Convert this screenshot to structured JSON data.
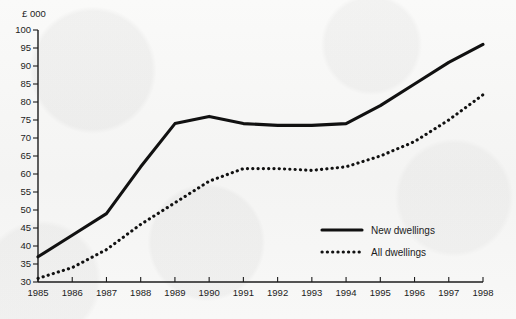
{
  "chart_data": {
    "type": "line",
    "title": "",
    "xlabel": "",
    "ylabel": "",
    "unit_label": "£ 000",
    "grid": false,
    "legend_position": "inside-right",
    "x": [
      1985,
      1986,
      1987,
      1988,
      1989,
      1990,
      1991,
      1992,
      1993,
      1994,
      1995,
      1996,
      1997,
      1998
    ],
    "categories": [
      "1985",
      "1986",
      "1987",
      "1988",
      "1989",
      "1990",
      "1991",
      "1992",
      "1993",
      "1994",
      "1995",
      "1996",
      "1997",
      "1998"
    ],
    "xlim": [
      1985,
      1998
    ],
    "ylim": [
      30,
      100
    ],
    "yticks": [
      30,
      35,
      40,
      45,
      50,
      55,
      60,
      65,
      70,
      75,
      80,
      85,
      90,
      95,
      100
    ],
    "series": [
      {
        "name": "New dwellings",
        "style": "solid",
        "color": "#111111",
        "values": [
          37,
          43,
          49,
          62,
          74,
          76,
          74,
          73.5,
          73.5,
          74,
          79,
          85,
          91,
          96
        ]
      },
      {
        "name": "All dwellings",
        "style": "dotted",
        "color": "#111111",
        "values": [
          31,
          34,
          39,
          46,
          52,
          58,
          61.5,
          61.5,
          61,
          62,
          65,
          69,
          75,
          82
        ]
      }
    ]
  },
  "legend": {
    "items": [
      {
        "label": "New dwellings",
        "style": "solid"
      },
      {
        "label": "All dwellings",
        "style": "dotted"
      }
    ]
  }
}
